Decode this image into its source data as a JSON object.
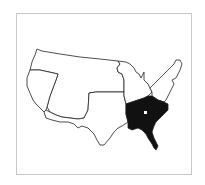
{
  "map": {
    "subject": "United States regions",
    "highlighted_region": "Southeast",
    "highlight_color": "#111111",
    "base_fill": "#ffffff",
    "outline_color": "#222222",
    "frame_color": "#c8c8c8",
    "regions": [
      {
        "id": "northwest",
        "highlighted": false
      },
      {
        "id": "west-coast-nevada",
        "highlighted": false
      },
      {
        "id": "southwest",
        "highlighted": false
      },
      {
        "id": "south-central",
        "highlighted": false
      },
      {
        "id": "midwest",
        "highlighted": false
      },
      {
        "id": "northeast",
        "highlighted": false
      },
      {
        "id": "southeast",
        "highlighted": true
      }
    ],
    "marker": {
      "shape": "square-dot",
      "color": "#ffffff",
      "region": "southeast"
    }
  }
}
